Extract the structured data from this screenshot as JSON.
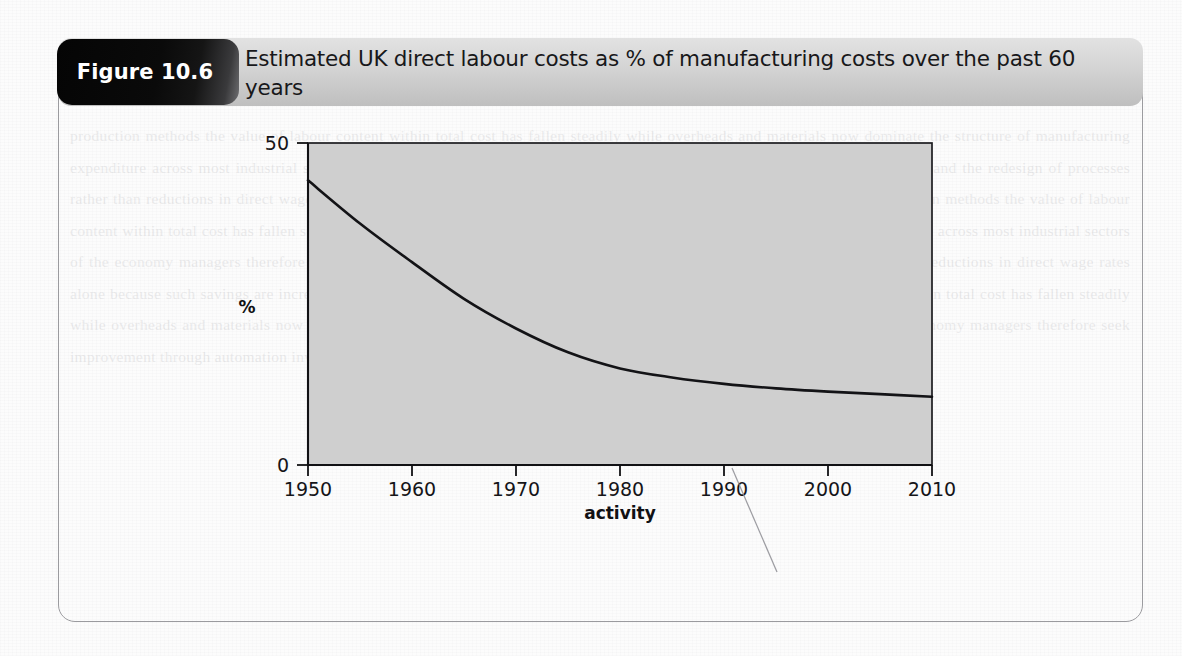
{
  "figure": {
    "number_label": "Figure 10.6",
    "title": "Estimated UK direct labour costs as % of manufacturing costs over the past 60 years"
  },
  "colors": {
    "tab_background": "#0a0a0a",
    "tab_text": "#ffffff",
    "header_background": "#d4d4d4",
    "figure_border": "#9b9b9f",
    "plot_background": "#d0d0d0",
    "plot_border": "#1a1a1a",
    "curve": "#111111",
    "page_background": "#fcfcfc"
  },
  "chart_data": {
    "type": "line",
    "title": "Estimated UK direct labour costs as % of manufacturing costs over the past 60 years",
    "xlabel": "activity",
    "ylabel": "%",
    "xlim": [
      1950,
      2010
    ],
    "ylim": [
      0,
      50
    ],
    "grid": false,
    "legend": "none",
    "xticks": [
      1950,
      1960,
      1970,
      1980,
      1990,
      2000,
      2010
    ],
    "xtick_labels": [
      "1950",
      "1960",
      "1970",
      "1980",
      "1990",
      "2000",
      "2010"
    ],
    "yticks": [
      0,
      50
    ],
    "ytick_labels": [
      "0",
      "50"
    ],
    "series": [
      {
        "name": "UK direct labour cost share",
        "x": [
          1950,
          1955,
          1960,
          1965,
          1970,
          1975,
          1980,
          1985,
          1990,
          1995,
          2000,
          2005,
          2010
        ],
        "values": [
          44.2,
          37.5,
          31.5,
          25.8,
          21.2,
          17.5,
          15.0,
          13.6,
          12.6,
          11.9,
          11.4,
          11.0,
          10.6
        ]
      }
    ],
    "annotations": [
      {
        "kind": "scan-artifact",
        "description": "faint diagonal pencil/scan line below x-axis near 1990"
      }
    ]
  },
  "background_ghost_text": "lines of faded show-through text from the reverse side of the scanned book page"
}
